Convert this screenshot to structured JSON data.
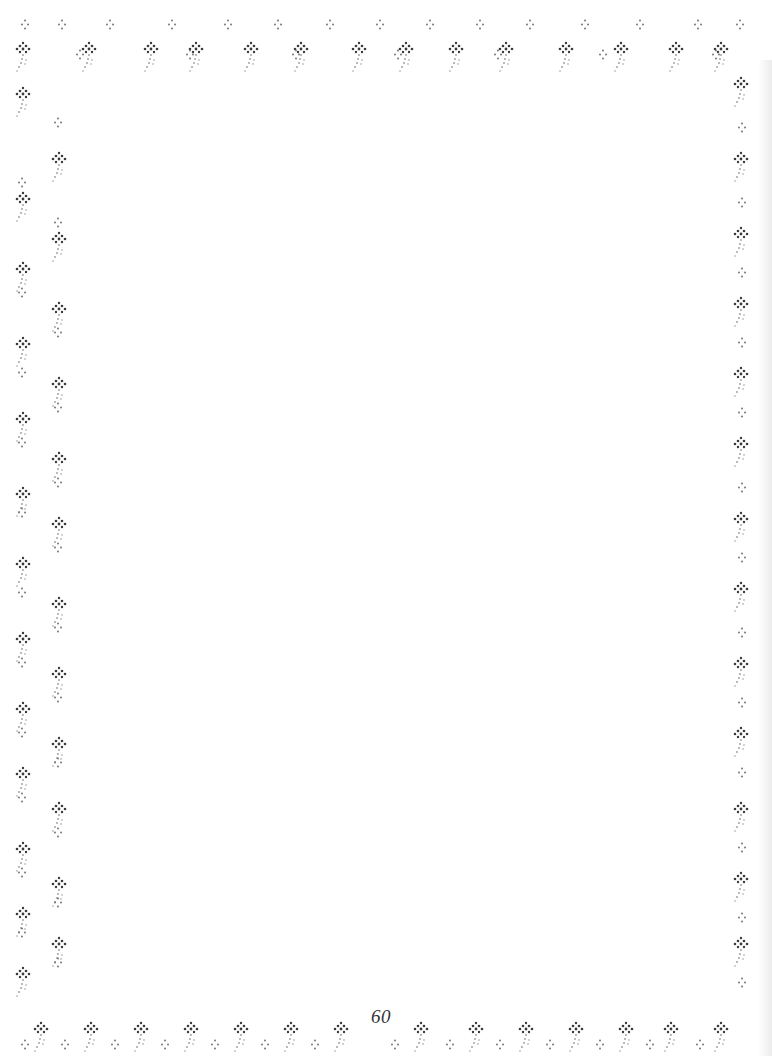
{
  "page": {
    "page_number": "60",
    "background": "#ffffff",
    "border_color": "#3a3a3a",
    "stem_color": "#9a9a9a"
  },
  "border": {
    "style": "cross-stitch floral border",
    "icons": {
      "flower": "cross-stitch-flower-icon",
      "dots": "four-dot-cluster-icon"
    },
    "top_flower_x": [
      22,
      88,
      150,
      195,
      250,
      300,
      358,
      405,
      455,
      505,
      565,
      620,
      675,
      720
    ],
    "top_dot_x": [
      25,
      62,
      110,
      172,
      228,
      278,
      330,
      380,
      430,
      480,
      530,
      585,
      640,
      698,
      740
    ],
    "bottom_flower_x": [
      40,
      90,
      140,
      190,
      240,
      290,
      340,
      420,
      475,
      525,
      575,
      625,
      670,
      720
    ],
    "bottom_dot_x": [
      25,
      65,
      115,
      165,
      215,
      265,
      315,
      395,
      450,
      500,
      550,
      600,
      650,
      700
    ],
    "left_flower_y": [
      95,
      160,
      200,
      240,
      270,
      310,
      345,
      385,
      420,
      460,
      495,
      525,
      565,
      605,
      640,
      675,
      710,
      745,
      775,
      810,
      850,
      885,
      915,
      945,
      975
    ],
    "left_dot_y": [
      120,
      180,
      220,
      290,
      330,
      370,
      405,
      440,
      480,
      510,
      545,
      590,
      625,
      660,
      695,
      730,
      760,
      795,
      830,
      870,
      900,
      930,
      960
    ],
    "right_flower_y": [
      85,
      160,
      235,
      305,
      375,
      445,
      520,
      590,
      665,
      735,
      810,
      880,
      945
    ],
    "right_dot_y": [
      125,
      200,
      270,
      340,
      410,
      485,
      555,
      630,
      700,
      770,
      845,
      915,
      980
    ]
  }
}
